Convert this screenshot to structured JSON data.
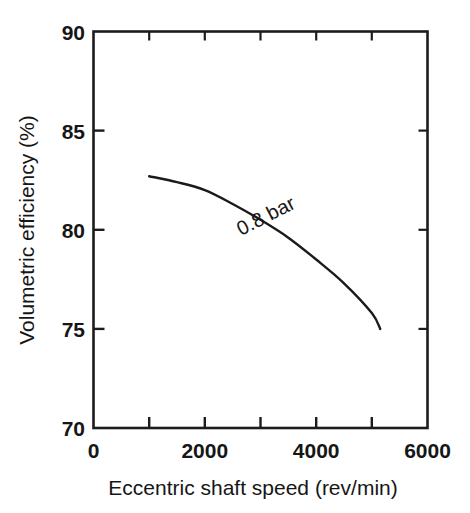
{
  "figure": {
    "background_color": "#ffffff",
    "ink_color": "#1a1a1a"
  },
  "chart_data": {
    "type": "line",
    "title": "",
    "subtitle": "",
    "xlabel": "Eccentric shaft speed (rev/min)",
    "ylabel": "Volumetric efficiency (%)",
    "xlim": [
      0,
      6000
    ],
    "ylim": [
      70,
      90
    ],
    "xticks": [
      0,
      1000,
      2000,
      3000,
      4000,
      5000,
      6000
    ],
    "xtick_labels": [
      "0",
      "",
      "2000",
      "",
      "4000",
      "",
      "6000"
    ],
    "yticks": [
      70,
      75,
      80,
      85,
      90
    ],
    "ytick_labels": [
      "70",
      "75",
      "80",
      "85",
      "90"
    ],
    "grid": false,
    "legend_position": "none",
    "annotations": [
      {
        "text": "0.8 bar",
        "x": 3150,
        "y": 80.4,
        "rotation_deg": -27
      }
    ],
    "series": [
      {
        "name": "0.8 bar",
        "x": [
          1000,
          1500,
          2000,
          2500,
          3000,
          3500,
          4000,
          4500,
          5000,
          5150
        ],
        "values": [
          82.7,
          82.4,
          82.0,
          81.3,
          80.5,
          79.6,
          78.5,
          77.3,
          75.8,
          75.0
        ]
      }
    ]
  },
  "axes": {
    "x_axis": {
      "label": "Eccentric shaft speed (rev/min)",
      "tick_labels": [
        "0",
        "2000",
        "4000",
        "6000"
      ]
    },
    "y_axis": {
      "label": "Volumetric efficiency (%)",
      "tick_labels": [
        "90",
        "85",
        "80",
        "75",
        "70"
      ]
    }
  },
  "curve_label": "0.8 bar"
}
